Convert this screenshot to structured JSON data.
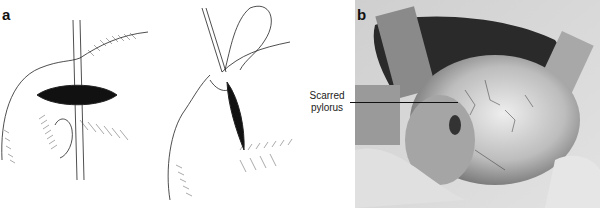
{
  "figure": {
    "panels": [
      {
        "letter": "a",
        "description": "Line drawings of pyloric incision and suture"
      },
      {
        "letter": "b",
        "description": "Shaded surgical illustration of exposed stomach"
      }
    ],
    "annotations": [
      {
        "line1": "Scarred",
        "line2": "pylorus"
      }
    ]
  }
}
